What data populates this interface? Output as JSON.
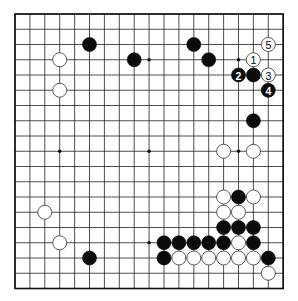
{
  "board": {
    "size": 19,
    "origin": {
      "x": 15,
      "y": 14
    },
    "spacing": {
      "x": 14.9,
      "y": 15.25
    },
    "stone_radius": 7,
    "star_points": [
      [
        3,
        3
      ],
      [
        9,
        3
      ],
      [
        15,
        3
      ],
      [
        3,
        9
      ],
      [
        9,
        9
      ],
      [
        15,
        9
      ],
      [
        3,
        15
      ],
      [
        9,
        15
      ],
      [
        15,
        15
      ]
    ],
    "colors": {
      "black": "#0b0b0b",
      "white": "#ffffff",
      "line": "#222222",
      "background": "#ffffff"
    }
  },
  "stones": [
    {
      "color": "black",
      "col": 5,
      "row": 2
    },
    {
      "color": "black",
      "col": 8,
      "row": 3
    },
    {
      "color": "white",
      "col": 3,
      "row": 3
    },
    {
      "color": "white",
      "col": 3,
      "row": 5
    },
    {
      "color": "black",
      "col": 12,
      "row": 2
    },
    {
      "color": "black",
      "col": 13,
      "row": 3
    },
    {
      "color": "white",
      "col": 17,
      "row": 2,
      "label": "5"
    },
    {
      "color": "white",
      "col": 16,
      "row": 3,
      "label": "1"
    },
    {
      "color": "black",
      "col": 15,
      "row": 4,
      "label": "2"
    },
    {
      "color": "black",
      "col": 16,
      "row": 4
    },
    {
      "color": "white",
      "col": 17,
      "row": 4,
      "label": "3"
    },
    {
      "color": "black",
      "col": 17,
      "row": 5,
      "label": "4"
    },
    {
      "color": "black",
      "col": 16,
      "row": 7
    },
    {
      "color": "white",
      "col": 14,
      "row": 9
    },
    {
      "color": "white",
      "col": 16,
      "row": 9
    },
    {
      "color": "white",
      "col": 14,
      "row": 12
    },
    {
      "color": "black",
      "col": 15,
      "row": 12
    },
    {
      "color": "white",
      "col": 16,
      "row": 12
    },
    {
      "color": "white",
      "col": 14,
      "row": 13
    },
    {
      "color": "white",
      "col": 15,
      "row": 13
    },
    {
      "color": "black",
      "col": 14,
      "row": 14
    },
    {
      "color": "black",
      "col": 15,
      "row": 14
    },
    {
      "color": "black",
      "col": 16,
      "row": 14
    },
    {
      "color": "black",
      "col": 10,
      "row": 15
    },
    {
      "color": "black",
      "col": 11,
      "row": 15
    },
    {
      "color": "black",
      "col": 12,
      "row": 15
    },
    {
      "color": "black",
      "col": 13,
      "row": 15
    },
    {
      "color": "black",
      "col": 14,
      "row": 15
    },
    {
      "color": "white",
      "col": 15,
      "row": 15
    },
    {
      "color": "black",
      "col": 16,
      "row": 15
    },
    {
      "color": "black",
      "col": 10,
      "row": 16
    },
    {
      "color": "white",
      "col": 11,
      "row": 16
    },
    {
      "color": "white",
      "col": 12,
      "row": 16
    },
    {
      "color": "white",
      "col": 13,
      "row": 16
    },
    {
      "color": "white",
      "col": 14,
      "row": 16
    },
    {
      "color": "white",
      "col": 15,
      "row": 16
    },
    {
      "color": "white",
      "col": 16,
      "row": 16
    },
    {
      "color": "black",
      "col": 17,
      "row": 16
    },
    {
      "color": "white",
      "col": 17,
      "row": 17
    },
    {
      "color": "white",
      "col": 2,
      "row": 13
    },
    {
      "color": "white",
      "col": 3,
      "row": 15
    },
    {
      "color": "black",
      "col": 5,
      "row": 16
    }
  ]
}
